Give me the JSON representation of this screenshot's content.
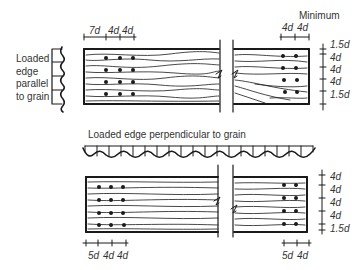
{
  "diagram": {
    "title_top": "Minimum",
    "parallel_label": [
      "Loaded",
      "edge",
      "parallel",
      "to grain"
    ],
    "perpendicular_label": "Loaded edge perpendicular to grain",
    "top_left_spacing": [
      "7d",
      "4d",
      "4d"
    ],
    "top_right_spacing": [
      "4d",
      "4d"
    ],
    "top_right_vertical": [
      "1.5d",
      "4d",
      "4d",
      "4d",
      "1.5d"
    ],
    "bottom_left_spacing": [
      "5d",
      "4d",
      "4d"
    ],
    "bottom_right_spacing": [
      "5d",
      "4d"
    ],
    "bottom_right_vertical": [
      "4d",
      "4d",
      "4d",
      "4d",
      "1.5d"
    ],
    "line_color": "#1a1a1a"
  }
}
